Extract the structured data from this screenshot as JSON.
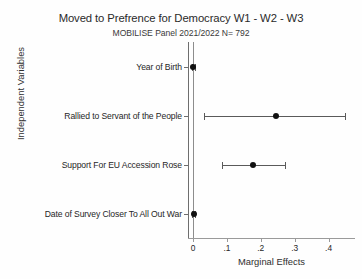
{
  "chart_data": {
    "type": "scatter",
    "title": "Moved to Prefrence for Democracy W1 - W2 - W3",
    "subtitle": "MOBILISE Panel 2021/2022 N= 792",
    "xlabel": "Marginal Effects",
    "ylabel": "Independent Variables",
    "xlim": [
      -0.015,
      0.477
    ],
    "xticks": [
      0,
      0.1,
      0.2,
      0.3,
      0.4
    ],
    "xtick_labels": [
      "0",
      ".1",
      ".2",
      ".3",
      ".4"
    ],
    "grid": false,
    "legend": "none",
    "reference_line_x": 0,
    "categories": [
      "Year of Birth",
      "Rallied to Servant of the People",
      "Support For EU Accession Rose",
      "Date of Survey Closer To All Out War"
    ],
    "points": [
      {
        "label": "Year of Birth",
        "estimate": 0.001,
        "ci_low": -0.003,
        "ci_high": 0.005
      },
      {
        "label": "Rallied to Servant of the People",
        "estimate": 0.244,
        "ci_low": 0.032,
        "ci_high": 0.447
      },
      {
        "label": "Support For EU Accession Rose",
        "estimate": 0.176,
        "ci_low": 0.085,
        "ci_high": 0.27
      },
      {
        "label": "Date of Survey Closer To All Out War",
        "estimate": 0.002,
        "ci_low": -0.002,
        "ci_high": 0.007
      }
    ],
    "marker_color": "#111111",
    "ci_color": "#5a5a5a",
    "axis_color": "#8d8d8d"
  }
}
